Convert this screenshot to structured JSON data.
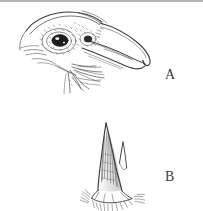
{
  "figure": {
    "background_color": "#ffffff",
    "ink_color": "#3b3b3e",
    "rule_color": "#b4b4b6",
    "width": 203,
    "height": 211
  },
  "panels": [
    {
      "id": "a",
      "label": "A",
      "subject": "bird-head-profile",
      "description": "Pen-and-ink profile drawing of a bird head with hooked bill, dark stippled eye and rictal bristles"
    },
    {
      "id": "b",
      "label": "B",
      "subject": "claw-detail",
      "description": "Pen-and-ink detail of a claw with hatched shading and a flared hatched base"
    }
  ],
  "icons": {
    "panel_a": "bird-head-icon",
    "panel_b": "claw-icon"
  }
}
